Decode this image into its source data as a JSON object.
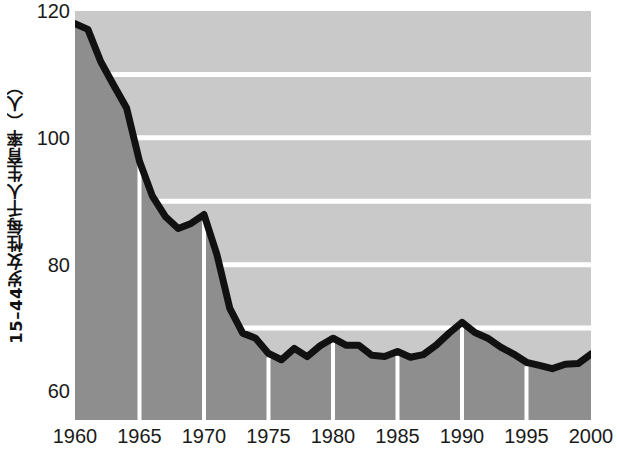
{
  "chart_data": {
    "type": "area",
    "title": "",
    "xlabel": "",
    "ylabel": "15–44岁女性每千人生育率（人）",
    "xlim": [
      1960,
      2000
    ],
    "ylim": [
      55.5,
      120
    ],
    "yticks": [
      60,
      80,
      100,
      120
    ],
    "ytick_labels": [
      "60",
      "80",
      "100",
      "120"
    ],
    "xticks": [
      1960,
      1965,
      1970,
      1975,
      1980,
      1985,
      1990,
      1995,
      2000
    ],
    "xtick_labels": [
      "1960",
      "1965",
      "1970",
      "1975",
      "1980",
      "1985",
      "1990",
      "1995",
      "2000"
    ],
    "gridlines_y": [
      70,
      80,
      90,
      100,
      110
    ],
    "gridlines_x": [
      1965,
      1970,
      1975,
      1980,
      1985,
      1990,
      1995
    ],
    "grid": true,
    "legend": "none",
    "colors": {
      "line": "#111111",
      "plot_background": "#c9c9c9",
      "area_fill": "#8e8e8e",
      "gridline": "#ffffff",
      "text": "#1a1a1a",
      "page_background": "#ffffff"
    },
    "series": [
      {
        "name": "15–44岁女性每千人生育率",
        "x": [
          1960,
          1961,
          1962,
          1963,
          1964,
          1965,
          1966,
          1967,
          1968,
          1969,
          1970,
          1971,
          1972,
          1973,
          1974,
          1975,
          1976,
          1977,
          1978,
          1979,
          1980,
          1981,
          1982,
          1983,
          1984,
          1985,
          1986,
          1987,
          1988,
          1989,
          1990,
          1991,
          1992,
          1993,
          1994,
          1995,
          1996,
          1997,
          1998,
          1999,
          2000
        ],
        "values": [
          118.0,
          117.1,
          112.0,
          108.3,
          104.7,
          96.3,
          90.8,
          87.6,
          85.7,
          86.5,
          87.9,
          81.6,
          73.1,
          69.2,
          68.4,
          66.0,
          65.0,
          66.8,
          65.5,
          67.2,
          68.4,
          67.3,
          67.3,
          65.7,
          65.5,
          66.3,
          65.4,
          65.8,
          67.3,
          69.2,
          70.9,
          69.3,
          68.4,
          67.0,
          65.9,
          64.6,
          64.1,
          63.6,
          64.3,
          64.4,
          65.9
        ]
      }
    ]
  }
}
